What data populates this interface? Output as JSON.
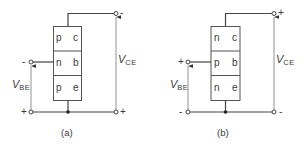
{
  "diagrams": [
    {
      "id": "a",
      "caption": "(a)",
      "type": "pnp",
      "regions": [
        {
          "doping": "p",
          "terminal": "c"
        },
        {
          "doping": "n",
          "terminal": "b"
        },
        {
          "doping": "p",
          "terminal": "e"
        }
      ],
      "vbe": {
        "label": "V",
        "subscript": "BE",
        "top_sign": "-",
        "bottom_sign": "+"
      },
      "vce": {
        "label": "V",
        "subscript": "CE",
        "top_sign": "-",
        "bottom_sign": "+"
      }
    },
    {
      "id": "b",
      "caption": "(b)",
      "type": "npn",
      "regions": [
        {
          "doping": "n",
          "terminal": "c"
        },
        {
          "doping": "p",
          "terminal": "b"
        },
        {
          "doping": "n",
          "terminal": "e"
        }
      ],
      "vbe": {
        "label": "V",
        "subscript": "BE",
        "top_sign": "+",
        "bottom_sign": "-"
      },
      "vce": {
        "label": "V",
        "subscript": "CE",
        "top_sign": "+",
        "bottom_sign": "-"
      }
    }
  ],
  "colors": {
    "line": "#4a4a4a",
    "text": "#3a3a3a",
    "background": "#ffffff"
  }
}
